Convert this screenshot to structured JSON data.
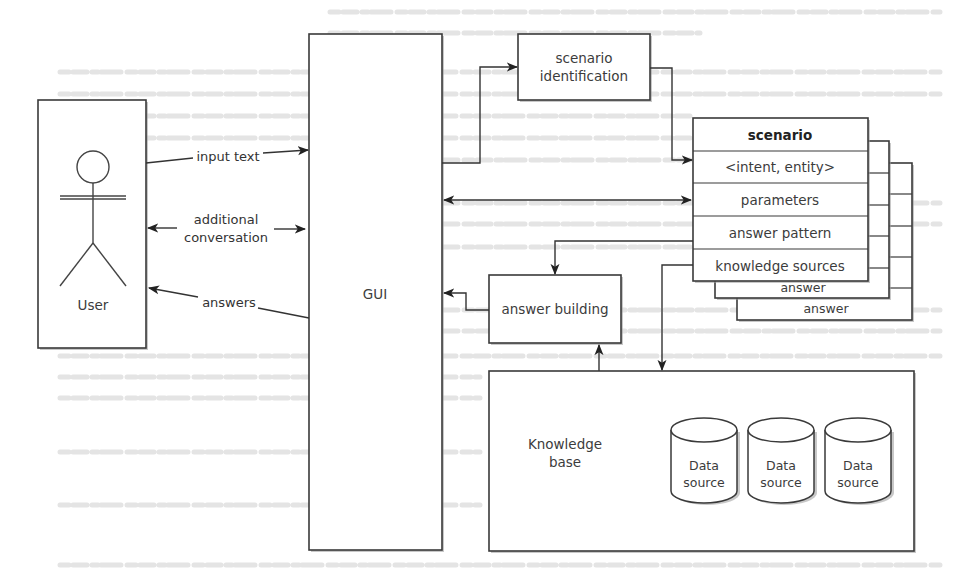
{
  "diagram": {
    "type": "architecture",
    "colors": {
      "stroke": "#3a3a3a",
      "text": "#3c3c3c",
      "background": "#ffffff"
    },
    "actor": {
      "label": "User",
      "icon": "stick-figure-icon"
    },
    "gui": {
      "label": "GUI"
    },
    "scenario_identification": {
      "line1": "scenario",
      "line2": "identification"
    },
    "scenario_card": {
      "title": "scenario",
      "rows": [
        "<intent, entity>",
        "parameters",
        "answer pattern",
        "knowledge sources"
      ],
      "stacked_labels": [
        "answer",
        "answer"
      ]
    },
    "answer_building": {
      "label": "answer building"
    },
    "knowledge_base": {
      "line1": "Knowledge",
      "line2": "base",
      "data_sources": [
        {
          "line1": "Data",
          "line2": "source"
        },
        {
          "line1": "Data",
          "line2": "source"
        },
        {
          "line1": "Data",
          "line2": "source"
        }
      ]
    },
    "edges": {
      "input_text": "input text",
      "additional_line1": "additional",
      "additional_line2": "conversation",
      "answers": "answers"
    }
  }
}
